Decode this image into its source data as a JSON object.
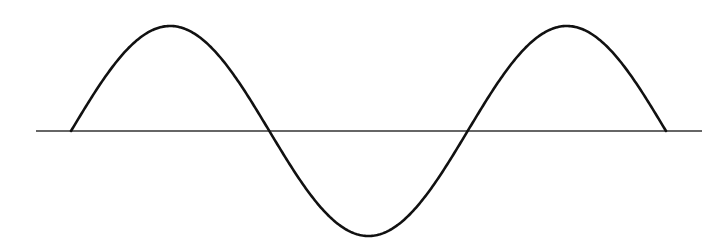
{
  "chart_data": {
    "type": "line",
    "title": "",
    "xlabel": "",
    "ylabel": "",
    "function": "sin(x)",
    "x_domain": [
      0,
      9.42477796
    ],
    "periods": 1.5,
    "ylim": [
      -1,
      1
    ],
    "grid": false,
    "legend": "none",
    "series": [
      {
        "name": "sine-wave",
        "x": [
          0,
          1.5708,
          3.1416,
          4.7124,
          6.2832,
          7.854,
          9.4248
        ],
        "values": [
          0,
          1,
          0,
          -1,
          0,
          1,
          0
        ]
      }
    ],
    "zero_crossings": [
      0,
      3.1416,
      6.2832,
      9.4248
    ],
    "peaks": [
      1.5708,
      7.854
    ],
    "troughs": [
      4.7124
    ],
    "colors": {
      "curve": "#111111",
      "axis": "#333333",
      "background": "#ffffff"
    }
  }
}
